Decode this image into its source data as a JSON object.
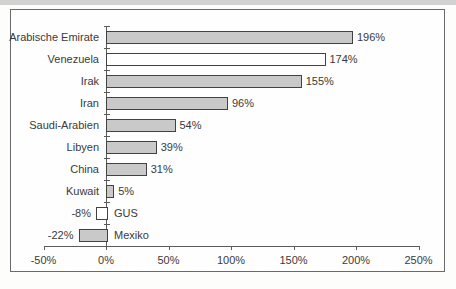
{
  "chart_data": {
    "type": "bar",
    "orientation": "horizontal",
    "title": "",
    "categories": [
      "Arabische Emirate",
      "Venezuela",
      "Irak",
      "Iran",
      "Saudi-Arabien",
      "Libyen",
      "China",
      "Kuwait",
      "GUS",
      "Mexiko"
    ],
    "values": [
      196,
      174,
      155,
      96,
      54,
      39,
      31,
      5,
      -8,
      -22
    ],
    "value_labels": [
      "196%",
      "174%",
      "155%",
      "96%",
      "54%",
      "39%",
      "31%",
      "5%",
      "-8%",
      "-22%"
    ],
    "bar_fills": [
      "gray",
      "white",
      "gray",
      "gray",
      "gray",
      "gray",
      "gray",
      "gray",
      "white",
      "gray"
    ],
    "x_ticks": [
      "-50%",
      "0%",
      "50%",
      "100%",
      "150%",
      "200%",
      "250%"
    ],
    "x_tick_values": [
      -50,
      0,
      50,
      100,
      150,
      200,
      250
    ],
    "xlim": [
      -50,
      250
    ],
    "xlabel": "",
    "ylabel": "",
    "grid": false,
    "legend": null
  },
  "colors": {
    "bar_gray": "#c9c9c9",
    "bar_white": "#ffffff",
    "bar_border": "#424242",
    "axis": "#5a5a5a",
    "frame_border": "#6a6a6a",
    "text": "#3a3a3a"
  }
}
